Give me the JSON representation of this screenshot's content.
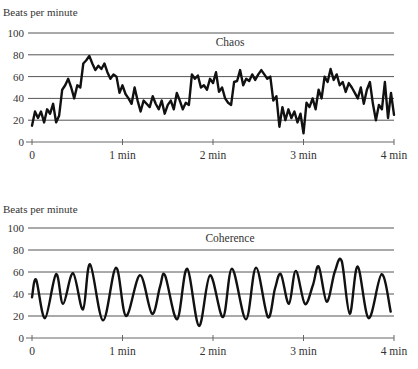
{
  "chart_data": [
    {
      "type": "line",
      "title": "Chaos",
      "ylabel": "Beats per minute",
      "xlabel": "",
      "ylim": [
        0,
        100
      ],
      "xlim_minutes": [
        0,
        4
      ],
      "y_ticks": [
        "0",
        "20",
        "40",
        "60",
        "80",
        "100"
      ],
      "x_ticks": [
        "0",
        "1 min",
        "2 min",
        "3 min",
        "4 min"
      ],
      "grid": true,
      "sample_interval_seconds": 2,
      "values": [
        15,
        28,
        22,
        28,
        18,
        30,
        26,
        35,
        18,
        24,
        48,
        52,
        58,
        50,
        40,
        52,
        50,
        72,
        75,
        79,
        72,
        66,
        70,
        67,
        72,
        64,
        58,
        62,
        60,
        45,
        52,
        44,
        40,
        35,
        50,
        38,
        28,
        38,
        35,
        32,
        42,
        35,
        30,
        38,
        26,
        34,
        38,
        30,
        45,
        38,
        30,
        36,
        34,
        62,
        58,
        61,
        50,
        52,
        48,
        58,
        54,
        64,
        46,
        50,
        40,
        36,
        34,
        55,
        56,
        66,
        52,
        58,
        56,
        62,
        57,
        62,
        66,
        62,
        58,
        60,
        38,
        42,
        14,
        32,
        20,
        30,
        22,
        28,
        18,
        26,
        8,
        36,
        32,
        40,
        30,
        48,
        40,
        60,
        55,
        67,
        57,
        62,
        52,
        55,
        46,
        54,
        50,
        45,
        40,
        50,
        35,
        48,
        55,
        35,
        20,
        34,
        30,
        55,
        22,
        45,
        25
      ]
    },
    {
      "type": "line",
      "title": "Coherence",
      "ylabel": "Beats per minute",
      "xlabel": "",
      "ylim": [
        0,
        100
      ],
      "xlim_minutes": [
        0,
        4
      ],
      "y_ticks": [
        "0",
        "20",
        "40",
        "60",
        "80",
        "100"
      ],
      "x_ticks": [
        "0",
        "1 min",
        "2 min",
        "3 min",
        "4 min"
      ],
      "grid": true,
      "smooth": true,
      "points_seconds": [
        0,
        2.7,
        8.6,
        15.9,
        20.6,
        27.2,
        33.8,
        38.5,
        47.1,
        55.7,
        62.3,
        71.6,
        79.6,
        84.9,
        88.2,
        96.2,
        102.8,
        110.7,
        118.0,
        126.6,
        132.6,
        141.9,
        148.5,
        156.4,
        161.1,
        165.0,
        170.3,
        174.9,
        180.9,
        186.2,
        190.1,
        195.4,
        200.7,
        205.3,
        210.6,
        215.9,
        223.2,
        231.8,
        237.8
      ],
      "values": [
        37,
        53,
        18,
        58,
        31,
        59,
        26,
        67,
        16,
        64,
        20,
        57,
        22,
        47,
        57,
        17,
        63,
        11,
        57,
        19,
        63,
        17,
        64,
        19,
        45,
        58,
        31,
        61,
        31,
        48,
        65,
        33,
        60,
        70,
        22,
        65,
        18,
        58,
        24
      ]
    }
  ]
}
